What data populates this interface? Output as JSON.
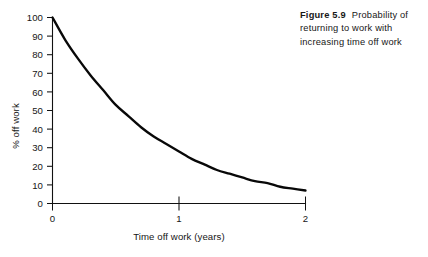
{
  "caption": {
    "figure_number": "Figure 5.9",
    "text": "Probability of returning to work with increasing time off work"
  },
  "chart_data": {
    "type": "line",
    "title": "",
    "subtitle": "",
    "xlabel": "Time off work (years)",
    "ylabel": "% off work",
    "xlim": [
      0,
      2
    ],
    "ylim": [
      0,
      100
    ],
    "xticks": [
      0,
      1,
      2
    ],
    "xticklabels": [
      "0",
      "1",
      "2"
    ],
    "yticks": [
      0,
      10,
      20,
      30,
      40,
      50,
      60,
      70,
      80,
      90,
      100
    ],
    "yticklabels": [
      "0",
      "10",
      "20",
      "30",
      "40",
      "50",
      "60",
      "70",
      "80",
      "90",
      "100"
    ],
    "grid": false,
    "legend": false,
    "legend_position": "none",
    "line_color": "#080808",
    "series": [
      {
        "name": "% off work",
        "x": [
          0.0,
          0.1,
          0.2,
          0.3,
          0.4,
          0.5,
          0.6,
          0.7,
          0.8,
          0.9,
          1.0,
          1.1,
          1.2,
          1.3,
          1.4,
          1.5,
          1.6,
          1.7,
          1.8,
          1.9,
          2.0
        ],
        "values": [
          100,
          88,
          78,
          69,
          61,
          53,
          47,
          41,
          36,
          32,
          28,
          24,
          21,
          18,
          16,
          14,
          12,
          11,
          9,
          8,
          7
        ]
      }
    ],
    "annotations": []
  }
}
